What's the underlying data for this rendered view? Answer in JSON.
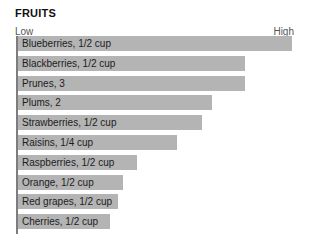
{
  "chart": {
    "title": "FRUITS",
    "scale": {
      "low_label": "Low",
      "high_label": "High"
    }
  },
  "chart_data": {
    "type": "bar",
    "orientation": "horizontal",
    "title": "FRUITS",
    "subtitle": "",
    "xlabel": "",
    "ylabel": "",
    "xlim": [
      0,
      100
    ],
    "grid": false,
    "legend": null,
    "axis_annotations": [
      "Low",
      "High"
    ],
    "categories": [
      "Blueberries, 1/2 cup",
      "Blackberries, 1/2 cup",
      "Prunes, 3",
      "Plums, 2",
      "Strawberries, 1/2 cup",
      "Raisins, 1/4 cup",
      "Raspberries, 1/2 cup",
      "Orange, 1/2 cup",
      "Red grapes, 1/2 cup",
      "Cherries, 1/2 cup"
    ],
    "values": [
      100,
      83,
      83,
      71,
      67,
      58,
      43,
      38,
      36,
      33
    ],
    "bar_color": "#b4b4b4",
    "axis_color": "#7d7d7d",
    "bars": [
      {
        "label": "Blueberries, 1/2 cup",
        "value": 100,
        "pixel_width": 274
      },
      {
        "label": "Blackberries, 1/2 cup",
        "value": 83,
        "pixel_width": 227
      },
      {
        "label": "Prunes, 3",
        "value": 83,
        "pixel_width": 227
      },
      {
        "label": "Plums, 2",
        "value": 71,
        "pixel_width": 194
      },
      {
        "label": "Strawberries, 1/2 cup",
        "value": 67,
        "pixel_width": 184
      },
      {
        "label": "Raisins, 1/4 cup",
        "value": 58,
        "pixel_width": 159
      },
      {
        "label": "Raspberries, 1/2 cup",
        "value": 43,
        "pixel_width": 119
      },
      {
        "label": "Orange, 1/2 cup",
        "value": 38,
        "pixel_width": 105
      },
      {
        "label": "Red grapes, 1/2 cup",
        "value": 36,
        "pixel_width": 100
      },
      {
        "label": "Cherries, 1/2 cup",
        "value": 33,
        "pixel_width": 92
      }
    ]
  }
}
